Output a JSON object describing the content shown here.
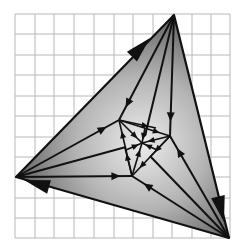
{
  "diagram": {
    "type": "pursuit-curve triangle on grid",
    "colors": {
      "background": "#ffffff",
      "grid": "#b8b8b8",
      "stroke": "#111111",
      "fill_center": "#e8e8e8",
      "fill_edge": "#7a7a7a"
    },
    "grid": {
      "x_lines": [
        15,
        35,
        54,
        74,
        94,
        114,
        133,
        153,
        172,
        192,
        211,
        230
      ],
      "y_lines": [
        14,
        34,
        55,
        75,
        96,
        116,
        137,
        157,
        177,
        198,
        218,
        238
      ]
    },
    "outer_triangle": {
      "vertices": [
        [
          174,
          15
        ],
        [
          229,
          238
        ],
        [
          16,
          177
        ]
      ],
      "labels": [
        "top",
        "bottom-right",
        "left"
      ]
    },
    "inner_triangle": {
      "vertices": [
        [
          119,
          120
        ],
        [
          170,
          136
        ],
        [
          132,
          176
        ]
      ]
    },
    "center": [
      142,
      143
    ],
    "big_arrows": [
      {
        "from": [
          16,
          177
        ],
        "to": [
          174,
          15
        ],
        "tip": [
          150,
          38
        ]
      },
      {
        "from": [
          174,
          15
        ],
        "to": [
          229,
          238
        ],
        "tip": [
          224,
          222
        ]
      },
      {
        "from": [
          229,
          238
        ],
        "to": [
          16,
          177
        ],
        "tip": [
          24,
          180
        ]
      }
    ],
    "rays": [
      {
        "from": [
          174,
          15
        ],
        "to": [
          119,
          120
        ],
        "arrow_at": 0.88
      },
      {
        "from": [
          174,
          15
        ],
        "to": [
          145,
          136
        ],
        "arrow_at": 0.0
      },
      {
        "from": [
          174,
          15
        ],
        "to": [
          170,
          136
        ],
        "arrow_at": 0.88
      },
      {
        "from": [
          229,
          238
        ],
        "to": [
          170,
          136
        ],
        "arrow_at": 0.88
      },
      {
        "from": [
          229,
          238
        ],
        "to": [
          150,
          156
        ],
        "arrow_at": 0.0
      },
      {
        "from": [
          229,
          238
        ],
        "to": [
          132,
          176
        ],
        "arrow_at": 0.88
      },
      {
        "from": [
          16,
          177
        ],
        "to": [
          132,
          176
        ],
        "arrow_at": 0.9
      },
      {
        "from": [
          16,
          177
        ],
        "to": [
          126,
          147
        ],
        "arrow_at": 0.0
      },
      {
        "from": [
          16,
          177
        ],
        "to": [
          119,
          120
        ],
        "arrow_at": 0.88
      }
    ],
    "inner_arrows": [
      {
        "from": [
          119,
          120
        ],
        "to": [
          170,
          136
        ]
      },
      {
        "from": [
          170,
          136
        ],
        "to": [
          132,
          176
        ]
      },
      {
        "from": [
          132,
          176
        ],
        "to": [
          119,
          120
        ]
      },
      {
        "from": [
          119,
          120
        ],
        "to": [
          142,
          143
        ]
      },
      {
        "from": [
          170,
          136
        ],
        "to": [
          142,
          143
        ]
      },
      {
        "from": [
          132,
          176
        ],
        "to": [
          142,
          143
        ]
      },
      {
        "from": [
          119,
          120
        ],
        "to": [
          156,
          128
        ]
      },
      {
        "from": [
          170,
          136
        ],
        "to": [
          151,
          156
        ]
      },
      {
        "from": [
          132,
          176
        ],
        "to": [
          125,
          148
        ]
      },
      {
        "from": [
          145,
          128
        ],
        "to": [
          142,
          143
        ]
      },
      {
        "from": [
          157,
          150
        ],
        "to": [
          142,
          143
        ]
      },
      {
        "from": [
          126,
          150
        ],
        "to": [
          142,
          143
        ]
      }
    ]
  }
}
